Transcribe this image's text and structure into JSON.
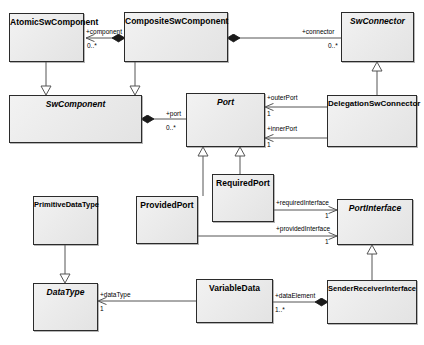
{
  "diagram": {
    "type": "uml-class-diagram",
    "canvas": {
      "width": 424,
      "height": 345
    },
    "colors": {
      "box_fill": "#ebebeb",
      "box_border": "#2b2b2b",
      "line": "#555555",
      "text": "#000000",
      "background": "#ffffff"
    },
    "classes": [
      {
        "id": "atomic_sw_component",
        "name": "AtomicSwComponent",
        "abstract": false,
        "x": 9,
        "y": 13,
        "w": 75,
        "h": 49
      },
      {
        "id": "composite_sw_component",
        "name": "CompositeSwComponent",
        "abstract": false,
        "x": 124,
        "y": 12,
        "w": 104,
        "h": 50
      },
      {
        "id": "sw_connector",
        "name": "SwConnector",
        "abstract": true,
        "x": 341,
        "y": 12,
        "w": 73,
        "h": 50
      },
      {
        "id": "sw_component",
        "name": "SwComponent",
        "abstract": true,
        "x": 9,
        "y": 95,
        "w": 133,
        "h": 48
      },
      {
        "id": "port",
        "name": "Port",
        "abstract": true,
        "x": 186,
        "y": 93,
        "w": 79,
        "h": 54
      },
      {
        "id": "delegation_sw_connector",
        "name": "DelegationSwConnector",
        "abstract": false,
        "x": 327,
        "y": 95,
        "w": 90,
        "h": 52
      },
      {
        "id": "required_port",
        "name": "RequiredPort",
        "abstract": false,
        "x": 212,
        "y": 174,
        "w": 62,
        "h": 48
      },
      {
        "id": "provided_port",
        "name": "ProvidedPort",
        "abstract": false,
        "x": 136,
        "y": 196,
        "w": 62,
        "h": 48
      },
      {
        "id": "port_interface",
        "name": "PortInterface",
        "abstract": true,
        "x": 337,
        "y": 199,
        "w": 76,
        "h": 46
      },
      {
        "id": "primitive_data_type",
        "name": "PrimitiveDataType",
        "abstract": false,
        "x": 33,
        "y": 196,
        "w": 65,
        "h": 49
      },
      {
        "id": "data_type",
        "name": "DataType",
        "abstract": true,
        "x": 33,
        "y": 283,
        "w": 65,
        "h": 48
      },
      {
        "id": "variable_data",
        "name": "VariableData",
        "abstract": false,
        "x": 196,
        "y": 279,
        "w": 77,
        "h": 44
      },
      {
        "id": "sender_receiver_interface",
        "name": "SenderReceiverInterface",
        "abstract": false,
        "x": 327,
        "y": 280,
        "w": 90,
        "h": 44
      }
    ],
    "relationships": [
      {
        "id": "rel_component",
        "kind": "composition",
        "source": "composite_sw_component",
        "target": "atomic_sw_component",
        "role_label": "+component",
        "multiplicity": "0..*"
      },
      {
        "id": "rel_connector",
        "kind": "composition",
        "source": "composite_sw_component",
        "target": "sw_connector",
        "role_label": "+connector",
        "multiplicity": "0..*"
      },
      {
        "id": "rel_atomic_generalization",
        "kind": "generalization",
        "source": "atomic_sw_component",
        "target": "sw_component",
        "role_label": "",
        "multiplicity": ""
      },
      {
        "id": "rel_composite_generalization",
        "kind": "generalization",
        "source": "composite_sw_component",
        "target": "sw_component",
        "role_label": "",
        "multiplicity": ""
      },
      {
        "id": "rel_port",
        "kind": "composition",
        "source": "sw_component",
        "target": "port",
        "role_label": "+port",
        "multiplicity": "0..*"
      },
      {
        "id": "rel_outer_port",
        "kind": "association",
        "source": "delegation_sw_connector",
        "target": "port",
        "role_label": "+outerPort",
        "multiplicity": "1"
      },
      {
        "id": "rel_inner_port",
        "kind": "association",
        "source": "delegation_sw_connector",
        "target": "port",
        "role_label": "+innerPort",
        "multiplicity": "1"
      },
      {
        "id": "rel_delegation_generalization",
        "kind": "generalization",
        "source": "delegation_sw_connector",
        "target": "sw_connector",
        "role_label": "",
        "multiplicity": ""
      },
      {
        "id": "rel_required_port_generalization",
        "kind": "generalization",
        "source": "required_port",
        "target": "port",
        "role_label": "",
        "multiplicity": ""
      },
      {
        "id": "rel_provided_port_generalization",
        "kind": "generalization",
        "source": "provided_port",
        "target": "port",
        "role_label": "",
        "multiplicity": ""
      },
      {
        "id": "rel_required_interface",
        "kind": "association",
        "source": "required_port",
        "target": "port_interface",
        "role_label": "+requiredInterface",
        "multiplicity": "1"
      },
      {
        "id": "rel_provided_interface",
        "kind": "association",
        "source": "provided_port",
        "target": "port_interface",
        "role_label": "+providedInterface",
        "multiplicity": "1"
      },
      {
        "id": "rel_primitive_generalization",
        "kind": "generalization",
        "source": "primitive_data_type",
        "target": "data_type",
        "role_label": "",
        "multiplicity": ""
      },
      {
        "id": "rel_data_type",
        "kind": "association",
        "source": "variable_data",
        "target": "data_type",
        "role_label": "+dataType",
        "multiplicity": "1"
      },
      {
        "id": "rel_data_element",
        "kind": "composition",
        "source": "sender_receiver_interface",
        "target": "variable_data",
        "role_label": "+dataElement",
        "multiplicity": "1..*"
      },
      {
        "id": "rel_sender_receiver_generalization",
        "kind": "generalization",
        "source": "sender_receiver_interface",
        "target": "port_interface",
        "role_label": "",
        "multiplicity": ""
      }
    ],
    "labels": [
      {
        "id": "lbl_component",
        "text": "+component",
        "x": 86,
        "y": 28
      },
      {
        "id": "lbl_component_mult",
        "text": "0..*",
        "x": 87,
        "y": 42
      },
      {
        "id": "lbl_connector",
        "text": "+connector",
        "x": 302,
        "y": 28
      },
      {
        "id": "lbl_connector_mult",
        "text": "0..*",
        "x": 328,
        "y": 42
      },
      {
        "id": "lbl_port",
        "text": "+port",
        "x": 168,
        "y": 112
      },
      {
        "id": "lbl_port_mult",
        "text": "0..*",
        "x": 168,
        "y": 126
      },
      {
        "id": "lbl_outer_port",
        "text": "+outerPort",
        "x": 268,
        "y": 96
      },
      {
        "id": "lbl_outer_port_mult",
        "text": "1",
        "x": 268,
        "y": 110
      },
      {
        "id": "lbl_inner_port",
        "text": "+innerPort",
        "x": 268,
        "y": 127
      },
      {
        "id": "lbl_inner_port_mult",
        "text": "1",
        "x": 268,
        "y": 141
      },
      {
        "id": "lbl_required_interface",
        "text": "+requiredInterface",
        "x": 277,
        "y": 201
      },
      {
        "id": "lbl_required_interface_mult",
        "text": "1",
        "x": 325,
        "y": 213
      },
      {
        "id": "lbl_provided_interface",
        "text": "+providedInterface",
        "x": 277,
        "y": 227
      },
      {
        "id": "lbl_provided_interface_mult",
        "text": "1",
        "x": 325,
        "y": 239
      },
      {
        "id": "lbl_data_type",
        "text": "+dataType",
        "x": 100,
        "y": 293
      },
      {
        "id": "lbl_data_type_mult",
        "text": "1",
        "x": 100,
        "y": 306
      },
      {
        "id": "lbl_data_element",
        "text": "+dataElement",
        "x": 276,
        "y": 294
      },
      {
        "id": "lbl_data_element_mult",
        "text": "1..*",
        "x": 276,
        "y": 308
      }
    ]
  }
}
